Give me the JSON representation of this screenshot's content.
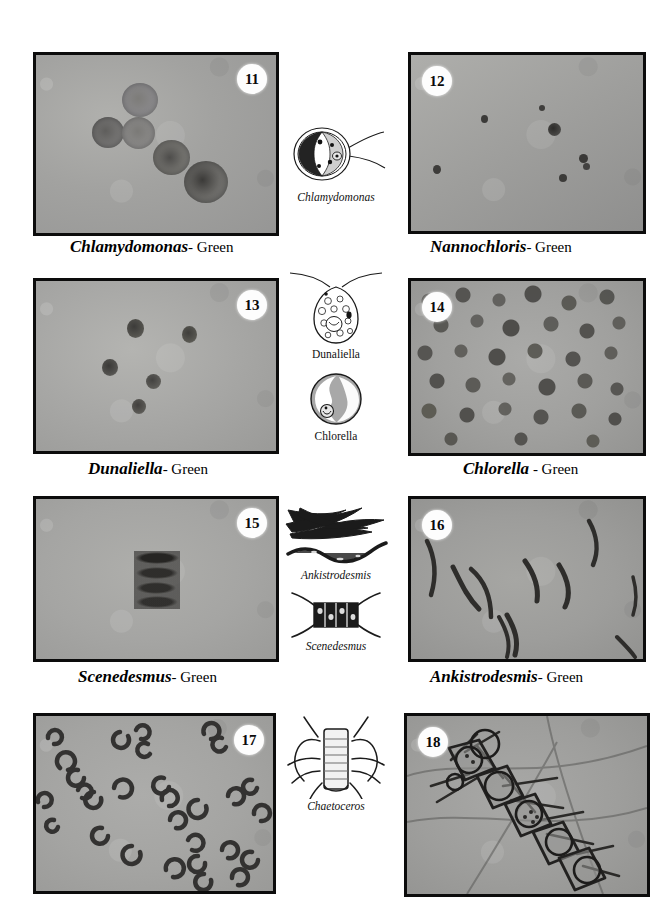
{
  "plate": {
    "title": "Algae micrograph plate, figures 11-18",
    "background_color": "#ffffff"
  },
  "panels": [
    {
      "number": "11",
      "badge_position": "top-right",
      "genus": "Chlamydomonas",
      "group_label": "- Green",
      "field_color": "#a3a3a3",
      "organism_shape": "round-cells-with-dark-pyrenoid",
      "cell_count": 5
    },
    {
      "number": "12",
      "badge_position": "top-left",
      "genus": "Nannochloris",
      "group_label": "- Green",
      "field_color": "#9b9b9b",
      "organism_shape": "tiny-dark-dots",
      "cell_count": 6
    },
    {
      "number": "13",
      "badge_position": "top-right",
      "genus": "Dunaliella",
      "group_label": "- Green",
      "field_color": "#a8a8a8",
      "organism_shape": "small-dark-ovals",
      "cell_count": 5
    },
    {
      "number": "14",
      "badge_position": "top-left",
      "genus": "Chlorella",
      "group_label": " - Green",
      "field_color": "#a0a0a0",
      "organism_shape": "dense-round-cells",
      "cell_count": 46
    },
    {
      "number": "15",
      "badge_position": "top-right",
      "genus": "Scenedesmus",
      "group_label": "- Green",
      "field_color": "#a6a6a6",
      "organism_shape": "four-cell-stacked-coenobium",
      "cell_count": 1
    },
    {
      "number": "16",
      "badge_position": "top-left",
      "genus": "Ankistrodesmis",
      "group_label": "- Green",
      "field_color": "#9d9d9d",
      "organism_shape": "curved-needle-cells",
      "cell_count": 9
    },
    {
      "number": "17",
      "badge_position": "top-right",
      "genus": "",
      "group_label": "",
      "field_color": "#a4a4a4",
      "organism_shape": "many-small-crescents",
      "cell_count": 34
    },
    {
      "number": "18",
      "badge_position": "top-left",
      "genus": "",
      "group_label": "",
      "field_color": "#9c9c9c",
      "organism_shape": "diatom-chain-with-setae",
      "cell_count": 6
    }
  ],
  "captions": [
    {
      "genus": "Chlamydomonas",
      "group": "- Green"
    },
    {
      "genus": "Nannochloris",
      "group": "- Green"
    },
    {
      "genus": "Dunaliella",
      "group": "- Green"
    },
    {
      "genus": "Chlorella",
      "group": " - Green"
    },
    {
      "genus": "Scenedesmus",
      "group": "- Green"
    },
    {
      "genus": "Ankistrodesmis",
      "group": "- Green"
    }
  ],
  "diagrams": [
    {
      "label": "Chlamydomonas",
      "style": "italic",
      "depicts": "biflagellate-round-cell-with-chloroplast"
    },
    {
      "label": "Dunaliella",
      "style": "upright",
      "depicts": "biflagellate-pear-shaped-cell"
    },
    {
      "label": "Chlorella",
      "style": "upright",
      "depicts": "round-cell-with-cup-chloroplast"
    },
    {
      "label": "Ankistrodesmis",
      "style": "italic",
      "depicts": "needle-shaped-spindle-cells"
    },
    {
      "label": "Scenedesmus",
      "style": "italic",
      "depicts": "four-celled-colony-with-spines"
    },
    {
      "label": "Chaetoceros",
      "style": "italic",
      "depicts": "diatom-chain-with-long-setae"
    }
  ]
}
